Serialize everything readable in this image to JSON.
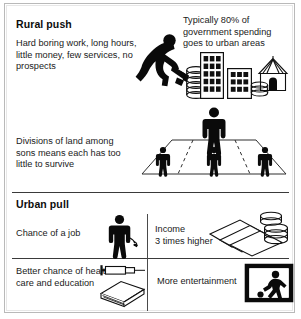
{
  "poster": {
    "title_hidden": "Rural push and urban pull factors"
  },
  "sections": {
    "rural": {
      "heading": "Rural push",
      "reasons_text": "Hard boring work, long hours, little money, few services, no prospects",
      "spending_text": "Typically 80% of government spending goes to urban areas",
      "land_text": "Divisions of land among sons means each has too little to survive",
      "icons": {
        "farmer": "farmer-hoeing-icon",
        "coins_tall": "coin-stack-icon",
        "building_tall": "tall-office-building-icon",
        "building_short": "short-office-building-icon",
        "hut": "rural-hut-icon",
        "coins_small": "small-coin-stack-icon",
        "field": "divided-field-diagram",
        "father": "father-figure-icon",
        "son": "son-figure-icon"
      },
      "figures": {
        "father_count": 1,
        "son_count": 3,
        "plot_count": 4
      },
      "building_windows": {
        "tall_cols": 3,
        "tall_rows": 5,
        "short_cols": 3,
        "short_rows": 3
      },
      "spending_percent": "80%"
    },
    "urban": {
      "heading": "Urban pull",
      "cells": [
        {
          "label": "Chance of a job",
          "icon": "worker-figure-icon"
        },
        {
          "label": "Income\n3 times higher",
          "icon": "money-notes-and-coins-icon"
        },
        {
          "label": "Better chance of health care and education",
          "icon": "syringe-and-book-icon"
        },
        {
          "label": "More entertainment",
          "icon": "television-football-icon"
        }
      ],
      "cell_labels": {
        "job": "Chance of a job",
        "income_line1": "Income",
        "income_line2": "3 times higher",
        "health": "Better chance of health care and education",
        "entertainment": "More entertainment"
      },
      "income_multiplier": "3 times higher"
    }
  },
  "colors": {
    "ink": "#111111",
    "line": "#3a3a3a",
    "frame": "#b9b9b9",
    "paper": "#ffffff"
  }
}
